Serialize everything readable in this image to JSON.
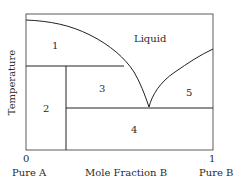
{
  "diagram": {
    "type": "binary eutectic phase diagram",
    "y_axis_label": "Temperature",
    "x_axis_label": "Mole Fraction B",
    "x_ticks": [
      "0",
      "1"
    ],
    "x_end_labels": {
      "left": "Pure A",
      "right": "Pure B"
    },
    "regions": {
      "liquid": "Liquid",
      "r1": "1",
      "r2": "2",
      "r3": "3",
      "r4": "4",
      "r5": "5"
    },
    "line_color": "#2a2a2a"
  }
}
